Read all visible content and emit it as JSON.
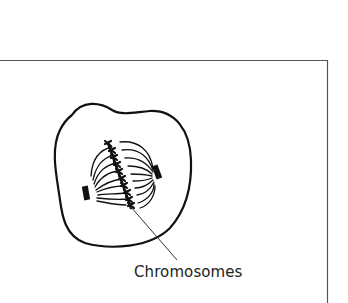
{
  "diagram": {
    "labels": [
      {
        "id": "chromosomes",
        "text": "Chromosomes",
        "points_to": "chromosomes aligned at metaphase plate"
      }
    ],
    "parts": [
      "outer-frame",
      "cell-membrane",
      "spindle-fibers",
      "chromosomes-metaphase-plate",
      "centrosome-left",
      "centrosome-right",
      "leader-line"
    ],
    "colors": {
      "stroke": "#111111",
      "frame": "#555555",
      "background": "#ffffff"
    }
  }
}
